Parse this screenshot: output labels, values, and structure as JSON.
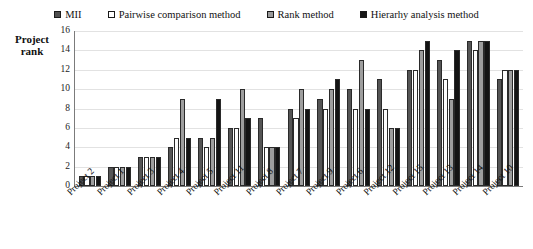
{
  "legend": {
    "position": "top-center",
    "items": [
      {
        "label": "MII",
        "swatch": "mii-swatch",
        "color": "#4f4f4f"
      },
      {
        "label": "Pairwise comparison method",
        "swatch": "pairwise-swatch",
        "color": "#ffffff"
      },
      {
        "label": "Rank method",
        "swatch": "rank-swatch",
        "color": "#9a9a9a"
      },
      {
        "label": "Hierarhy analysis method",
        "swatch": "hierarchy-swatch",
        "color": "#171717"
      }
    ]
  },
  "axis": {
    "y_title_line1": "Project",
    "y_title_line2": "rank",
    "y_ticks": [
      "16",
      "14",
      "12",
      "10",
      "8",
      "6",
      "4",
      "2",
      "0"
    ]
  },
  "chart_data": {
    "type": "bar",
    "title": "",
    "xlabel": "",
    "ylabel": "Project rank",
    "ylim": [
      0,
      16
    ],
    "ytick_step": 2,
    "grid": true,
    "legend_position": "top-center",
    "categories": [
      "Project 2",
      "Project 1",
      "Project 3",
      "Project 4",
      "Project 5",
      "Project 11",
      "Project 8",
      "Project 7",
      "Project 9",
      "Project 6",
      "Project 12",
      "Project 15",
      "Project 13",
      "Project 14",
      "Project 10"
    ],
    "series": [
      {
        "name": "MII",
        "color": "#4f4f4f",
        "values": [
          1,
          2,
          3,
          4,
          5,
          6,
          7,
          8,
          9,
          10,
          11,
          12,
          13,
          15,
          11
        ]
      },
      {
        "name": "Pairwise comparison method",
        "color": "#ffffff",
        "values": [
          1,
          2,
          3,
          5,
          4,
          6,
          4,
          7,
          8,
          8,
          8,
          12,
          11,
          14,
          12
        ]
      },
      {
        "name": "Rank method",
        "color": "#9a9a9a",
        "values": [
          1,
          2,
          3,
          9,
          5,
          10,
          4,
          10,
          10,
          13,
          6,
          14,
          9,
          15,
          12
        ]
      },
      {
        "name": "Hierarhy analysis method",
        "color": "#171717",
        "values": [
          1,
          2,
          3,
          5,
          9,
          7,
          4,
          8,
          11,
          8,
          6,
          15,
          14,
          15,
          12
        ]
      }
    ]
  }
}
